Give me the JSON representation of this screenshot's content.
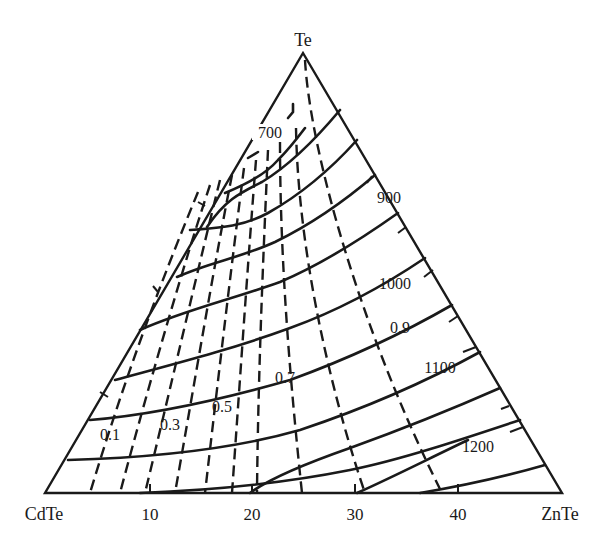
{
  "figure": {
    "type": "ternary-phase-diagram",
    "vertices": {
      "top": "Te",
      "left": "CdTe",
      "right": "ZnTe"
    },
    "base_axis": {
      "ticks": [
        "10",
        "20",
        "30",
        "40"
      ],
      "range": [
        0,
        50
      ]
    },
    "isotherm_labels": [
      "700",
      "900",
      "1000",
      "1100",
      "1200"
    ],
    "composition_labels": [
      "0.1",
      "0.3",
      "0.5",
      "0.7",
      "0.9"
    ],
    "line_styles": {
      "isotherms": "solid",
      "iso_composition": "dashed"
    },
    "colors": {
      "ink": "#1a1a1a",
      "background": "#ffffff"
    }
  }
}
